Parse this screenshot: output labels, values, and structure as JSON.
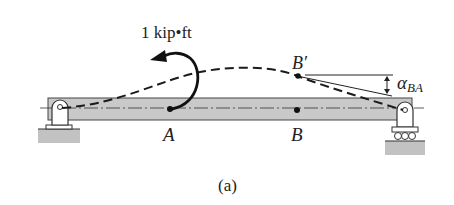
{
  "figure": {
    "caption": "(a)",
    "moment_label": "1 kip•ft",
    "points": {
      "a": "A",
      "b": "B",
      "b_prime": "B′"
    },
    "angle": {
      "symbol": "α",
      "subscript": "BA"
    },
    "elements": [
      "beam",
      "pin-support-left",
      "roller-support-right",
      "deflected-shape-dashed",
      "couple-moment-arrow-ccw",
      "tangent-line-at-B-prime",
      "centerline-dash-dot"
    ]
  },
  "colors": {
    "beam_fill": "#c9c9c9",
    "ground_fill": "#bdbdbd",
    "line": "#1a1a1a",
    "background": "#ffffff"
  }
}
